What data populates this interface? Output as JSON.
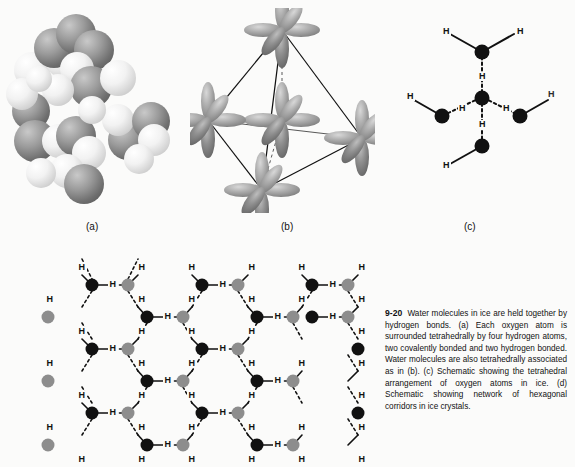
{
  "figure": {
    "panel_labels": {
      "a": "(a)",
      "b": "(b)",
      "c": "(c)"
    },
    "caption": {
      "number": "9-20",
      "text": "Water molecules in ice are held together by hydrogen bonds. (a) Each oxygen atom is surrounded tetrahedrally by four hydrogen atoms, two covalently bonded and two hydrogen bonded. Water molecules are also tetrahedrally associated as in (b). (c) Schematic showing the tetrahedral arrangement of oxygen atoms in ice. (d) Schematic showing network of hexagonal corridors in ice crystals."
    },
    "atom_label": "H",
    "colors": {
      "oxygen_dark": "#111111",
      "oxygen_gray": "#8d8d8d",
      "background": "#fbfbfa",
      "orbital_light": "#c9c9c9",
      "orbital_mid": "#9a9a9a",
      "bond_line": "#111111"
    },
    "panel_a": {
      "description": "space-filling model of water molecules",
      "sphere_types": [
        "oxygen",
        "hydrogen"
      ]
    },
    "panel_b": {
      "description": "tetrahedral sp3 orbital arrangement inside tetrahedron",
      "vertex_count": 4
    },
    "panel_c": {
      "description": "schematic of central oxygen tetrahedrally hydrogen bonded to four oxygens",
      "central_oxygen_count": 1,
      "peripheral_oxygen_count": 4,
      "hydrogen_labels": [
        "H",
        "H",
        "H",
        "H",
        "H",
        "H",
        "H",
        "H"
      ]
    },
    "panel_d": {
      "description": "hexagonal corridor network of ice crystal",
      "hydrogen_label": "H"
    }
  }
}
